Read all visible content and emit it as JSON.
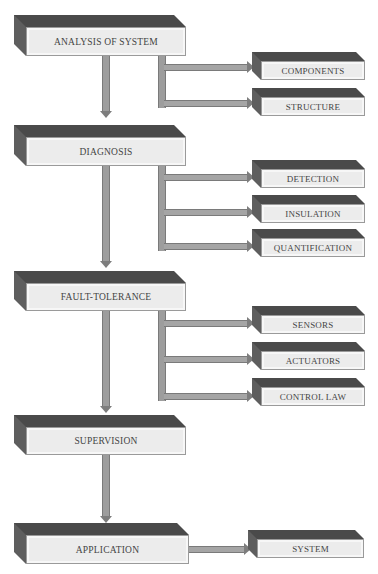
{
  "diagram": {
    "type": "flowchart",
    "stages": [
      {
        "label": "ANALYSIS OF SYSTEM",
        "children": [
          "COMPONENTS",
          "STRUCTURE"
        ]
      },
      {
        "label": "DIAGNOSIS",
        "children": [
          "DETECTION",
          "INSULATION",
          "QUANTIFICATION"
        ]
      },
      {
        "label": "FAULT-TOLERANCE",
        "children": [
          "SENSORS",
          "ACTUATORS",
          "CONTROL LAW"
        ]
      },
      {
        "label": "SUPERVISION",
        "children": []
      },
      {
        "label": "APPLICATION",
        "children": [
          "SYSTEM"
        ]
      }
    ]
  },
  "colors": {
    "box_top": "#4a4a4a",
    "box_side": "#5e5e5e",
    "box_face": "#ececec",
    "connector": "#9d9d9d"
  }
}
